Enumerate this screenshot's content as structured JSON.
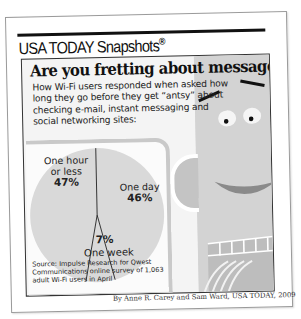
{
  "brand": {
    "name": "USA TODAY Snapshots",
    "mark": "®"
  },
  "headline": "Are you fretting about messages?",
  "description": "How Wi-Fi users responded when asked how long they go before they get “antsy” about checking e-mail, instant messaging and social networking sites:",
  "chart_data": {
    "type": "pie",
    "title": "Are you fretting about messages?",
    "categories": [
      "One hour or less",
      "One day",
      "One week"
    ],
    "values": [
      47,
      46,
      7
    ],
    "unit": "%",
    "labels": [
      {
        "name_line1": "One hour",
        "name_line2": "or less",
        "value": "47%"
      },
      {
        "name_line1": "One day",
        "name_line2": "",
        "value": "46%"
      },
      {
        "name_line1": "One week",
        "name_line2": "",
        "value": "7%"
      }
    ],
    "legend": "none"
  },
  "source": "Source: Impulse Research for Qwest Communications online survey of 1,063 adult Wi-Fi users in April",
  "credit": "By Anne R. Carey and Sam Ward, USA TODAY, 2009",
  "colors": {
    "pie_fill": "#d9d9d9",
    "panel_bg": "#f4f4f4",
    "face_gray": "#d6d6d6",
    "ink": "#111111"
  }
}
